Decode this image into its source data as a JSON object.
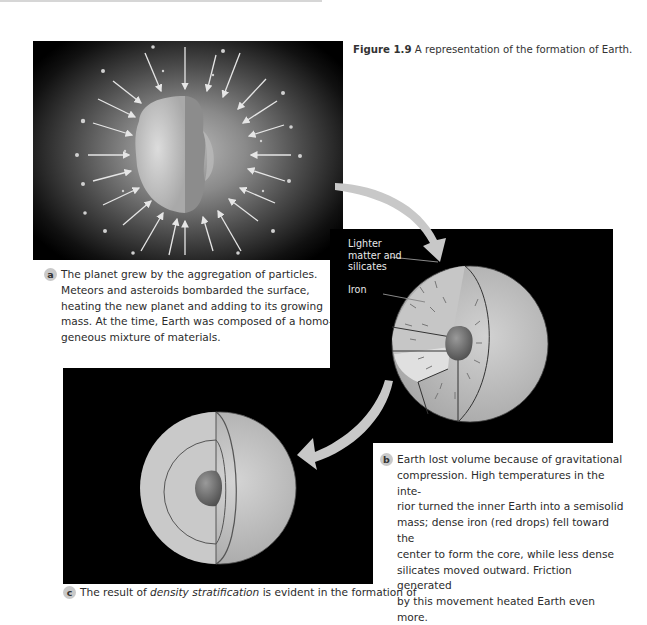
{
  "figure": {
    "label": "Figure 1.9",
    "caption": "A representation of the formation of Earth."
  },
  "panels": {
    "a": {
      "badge": "a",
      "lines": [
        "The planet grew by the aggregation of particles.",
        "Meteors and asteroids bombarded the surface,",
        "heating the new planet and adding to its growing",
        "mass. At the time, Earth was composed of a homo-",
        "geneous mixture of materials."
      ]
    },
    "b": {
      "badge": "b",
      "labels": {
        "lighter_line1": "Lighter",
        "lighter_line2": "matter and",
        "lighter_line3": "silicates",
        "iron": "Iron"
      },
      "lines": [
        "Earth lost volume because of gravitational",
        "compression. High temperatures in the inte-",
        "rior turned the inner Earth into a semisolid",
        "mass; dense iron (red drops) fell toward the",
        "center to form the core, while less dense",
        "silicates moved outward. Friction generated",
        "by this movement heated Earth even more."
      ]
    },
    "c": {
      "badge": "c",
      "text_before": "The result of ",
      "text_italic": "density stratification",
      "text_after": " is evident in the formation of"
    }
  },
  "colors": {
    "panel_background": "#000000",
    "badge_fill": "#c9c9c9",
    "arrow_fill": "#c8c8c8",
    "sphere_fill": "#bdbdbd",
    "core_fill": "#6e6e6e"
  }
}
